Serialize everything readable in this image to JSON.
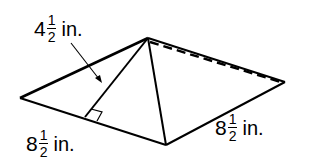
{
  "figure": {
    "type": "square-pyramid",
    "stroke_color": "#000000",
    "background_color": "#ffffff"
  },
  "labels": {
    "slant_height": {
      "whole": "4",
      "numerator": "1",
      "denominator": "2",
      "unit": "in.",
      "text": "4 1/2 in."
    },
    "base_edge_left": {
      "whole": "8",
      "numerator": "1",
      "denominator": "2",
      "unit": "in.",
      "text": "8 1/2 in."
    },
    "base_edge_right": {
      "whole": "8",
      "numerator": "1",
      "denominator": "2",
      "unit": "in.",
      "text": "8 1/2 in."
    }
  },
  "annotations": {
    "right_angle_marker": "slant height perpendicular to base edge",
    "hidden_edge": "dashed"
  }
}
